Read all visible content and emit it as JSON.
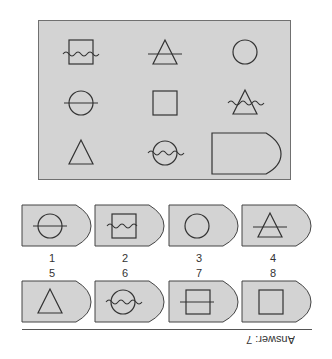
{
  "puzzle": {
    "grid": [
      {
        "row": 1,
        "col": 1,
        "shape": "square",
        "overlay": "wave"
      },
      {
        "row": 1,
        "col": 2,
        "shape": "triangle",
        "overlay": "line"
      },
      {
        "row": 1,
        "col": 3,
        "shape": "circle",
        "overlay": "none"
      },
      {
        "row": 2,
        "col": 1,
        "shape": "circle",
        "overlay": "line"
      },
      {
        "row": 2,
        "col": 2,
        "shape": "square",
        "overlay": "none"
      },
      {
        "row": 2,
        "col": 3,
        "shape": "triangle",
        "overlay": "wave"
      },
      {
        "row": 3,
        "col": 1,
        "shape": "triangle",
        "overlay": "none"
      },
      {
        "row": 3,
        "col": 2,
        "shape": "circle",
        "overlay": "wave"
      },
      {
        "row": 3,
        "col": 3,
        "shape": "blank-answer-tag",
        "overlay": "none"
      }
    ],
    "colors": {
      "panel": "#d3d3d3",
      "stroke": "#333333"
    }
  },
  "options": [
    {
      "label": "1",
      "shape": "circle",
      "overlay": "line"
    },
    {
      "label": "2",
      "shape": "square",
      "overlay": "wave"
    },
    {
      "label": "3",
      "shape": "circle",
      "overlay": "none"
    },
    {
      "label": "4",
      "shape": "triangle",
      "overlay": "line"
    },
    {
      "label": "5",
      "shape": "triangle",
      "overlay": "none"
    },
    {
      "label": "6",
      "shape": "circle",
      "overlay": "wave"
    },
    {
      "label": "7",
      "shape": "square",
      "overlay": "line"
    },
    {
      "label": "8",
      "shape": "square",
      "overlay": "none"
    }
  ],
  "answer": {
    "text": "Answer: 7"
  }
}
